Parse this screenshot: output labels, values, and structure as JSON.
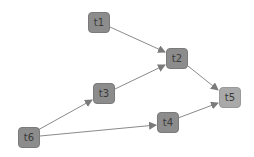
{
  "graph": {
    "nodes": [
      {
        "id": "t1",
        "label": "t1",
        "x": 88,
        "y": 12
      },
      {
        "id": "t2",
        "label": "t2",
        "x": 166,
        "y": 48
      },
      {
        "id": "t3",
        "label": "t3",
        "x": 93,
        "y": 83
      },
      {
        "id": "t4",
        "label": "t4",
        "x": 157,
        "y": 112
      },
      {
        "id": "t5",
        "label": "t5",
        "x": 219,
        "y": 87
      },
      {
        "id": "t6",
        "label": "t6",
        "x": 18,
        "y": 127
      }
    ],
    "edges": [
      {
        "from": "t1",
        "to": "t2"
      },
      {
        "from": "t3",
        "to": "t2"
      },
      {
        "from": "t2",
        "to": "t5"
      },
      {
        "from": "t6",
        "to": "t3"
      },
      {
        "from": "t6",
        "to": "t4"
      },
      {
        "from": "t4",
        "to": "t5"
      }
    ],
    "colors": {
      "node": "#8c8c8c",
      "node_highlight": "#a9a9a9",
      "edge": "#8a8a8a",
      "label": "#3a3a3a"
    }
  }
}
